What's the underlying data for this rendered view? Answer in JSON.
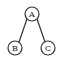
{
  "diagram": {
    "type": "tree",
    "nodes": [
      {
        "id": "A",
        "label": "A",
        "cx": 32,
        "cy": 14
      },
      {
        "id": "B",
        "label": "B",
        "cx": 15,
        "cy": 48
      },
      {
        "id": "C",
        "label": "C",
        "cx": 48,
        "cy": 48
      }
    ],
    "edges": [
      {
        "from": "A",
        "to": "B"
      },
      {
        "from": "A",
        "to": "C"
      }
    ],
    "node_radius": 7,
    "stroke_color": "#333333",
    "background": "#ffffff"
  }
}
